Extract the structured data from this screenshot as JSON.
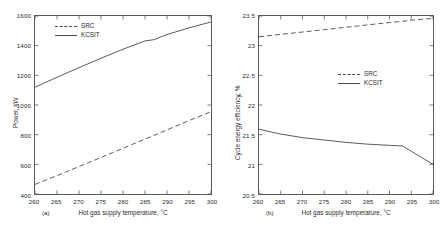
{
  "figure": {
    "panel_a_caption": "(a)",
    "panel_b_caption": "(b)"
  },
  "chart_data": [
    {
      "type": "line",
      "panel": "(a)",
      "title": "",
      "xlabel": "Hot gas supply temperature, °C",
      "ylabel": "Power, kW",
      "xlim": [
        260,
        300
      ],
      "ylim": [
        400,
        1600
      ],
      "xticks": [
        260,
        265,
        270,
        275,
        280,
        285,
        290,
        295,
        300
      ],
      "yticks": [
        400,
        600,
        800,
        1000,
        1200,
        1400,
        1600
      ],
      "grid": false,
      "legend_position": "upper-left",
      "x": [
        260,
        265,
        270,
        275,
        280,
        285,
        287,
        290,
        295,
        300
      ],
      "series": [
        {
          "name": "SRC",
          "style": "dashed",
          "values": [
            465,
            524,
            585,
            646,
            708,
            770,
            795,
            832,
            895,
            955
          ]
        },
        {
          "name": "KCSIT",
          "style": "solid",
          "values": [
            1120,
            1187,
            1252,
            1315,
            1376,
            1432,
            1440,
            1475,
            1520,
            1560
          ]
        }
      ]
    },
    {
      "type": "line",
      "panel": "(b)",
      "title": "",
      "xlabel": "Hot gas supply temperature, °C",
      "ylabel": "Cycle energy efficiency, %",
      "xlim": [
        260,
        300
      ],
      "ylim": [
        20.5,
        23.5
      ],
      "xticks": [
        260,
        265,
        270,
        275,
        280,
        285,
        290,
        295,
        300
      ],
      "yticks": [
        20.5,
        21,
        21.5,
        22,
        22.5,
        23,
        23.5
      ],
      "grid": false,
      "legend_position": "right-middle",
      "x": [
        260,
        265,
        270,
        275,
        280,
        285,
        290,
        293,
        295,
        300
      ],
      "series": [
        {
          "name": "SRC",
          "style": "dashed",
          "values": [
            23.15,
            23.19,
            23.23,
            23.27,
            23.31,
            23.35,
            23.39,
            23.41,
            23.43,
            23.46
          ]
        },
        {
          "name": "KCSIT",
          "style": "solid",
          "values": [
            21.59,
            21.51,
            21.45,
            21.41,
            21.37,
            21.34,
            21.32,
            21.31,
            21.22,
            21.0
          ]
        }
      ]
    }
  ],
  "panel_a": {
    "ylabel": "Power, kW",
    "xlabel": "Hot gas supply temperature, °C",
    "yticks": [
      "1600",
      "1400",
      "1200",
      "1000",
      "800",
      "600",
      "400"
    ],
    "xticks": [
      "260",
      "265",
      "270",
      "275",
      "280",
      "285",
      "290",
      "295",
      "300"
    ],
    "legend": [
      {
        "label": "SRC",
        "style": "dashed"
      },
      {
        "label": "KCSIT",
        "style": "solid"
      }
    ]
  },
  "panel_b": {
    "ylabel": "Cycle energy efficiency, %",
    "xlabel": "Hot gas supply temperature, °C",
    "yticks": [
      "23.5",
      "23",
      "22.5",
      "22",
      "21.5",
      "21",
      "20.5"
    ],
    "xticks": [
      "260",
      "265",
      "270",
      "275",
      "280",
      "285",
      "290",
      "295",
      "300"
    ],
    "legend": [
      {
        "label": "SRC",
        "style": "dashed"
      },
      {
        "label": "KCSIT",
        "style": "solid"
      }
    ]
  },
  "colors": {
    "line": "#4a4a4a",
    "axis": "#5a5a5a",
    "text": "#2b2b2b",
    "background": "#ffffff"
  }
}
